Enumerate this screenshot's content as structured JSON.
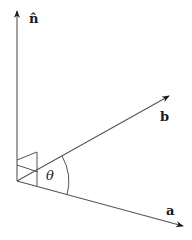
{
  "diagram": {
    "vectors": [
      {
        "name": "n",
        "label": "n̂",
        "from": [
          17,
          181
        ],
        "to": [
          17,
          10
        ]
      },
      {
        "name": "b",
        "label": "b",
        "from": [
          17,
          181
        ],
        "to": [
          170,
          95
        ]
      },
      {
        "name": "a",
        "label": "a",
        "from": [
          17,
          181
        ],
        "to": [
          184,
          226
        ]
      }
    ],
    "angle_label": "θ",
    "colors": {
      "line": "#555555",
      "arrow": "#1a1a1a",
      "text": "#1a1a1a"
    }
  }
}
